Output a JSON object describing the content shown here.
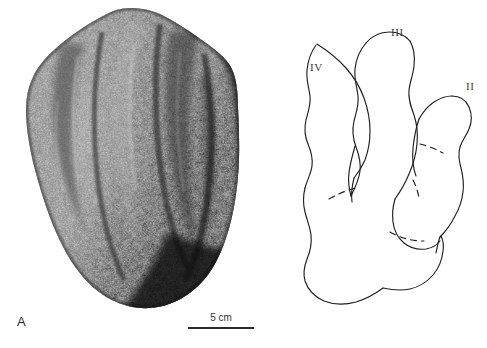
{
  "figure": {
    "width": 487,
    "height": 348,
    "background": "#ffffff"
  },
  "panel_a": {
    "letter": "A",
    "content_name": "rock-specimen-photograph",
    "description": "Greyscale photograph of a coarse rough rock slab bearing a natural cast of a tridactyl footprint",
    "scalebar": {
      "label": "5 cm",
      "length_px": 66
    }
  },
  "panel_b": {
    "letter": "B",
    "content_name": "footprint-interpretive-outline",
    "description": "Interpretive line drawing of the tridactyl footprint with solid outline and dashed pad-crease lines",
    "digit_labels": [
      {
        "id": "IV",
        "text": "IV"
      },
      {
        "id": "III",
        "text": "III"
      },
      {
        "id": "II",
        "text": "II"
      }
    ],
    "scalebar": {
      "label": "5 cm",
      "length_px": 48
    }
  },
  "colors": {
    "ink": "#2a2a2a",
    "label_text": "#2b2b2b",
    "digit_text": "#3a3a3a",
    "scale_text": "#333333",
    "outline_stroke": "#1f1f1f",
    "rock_dark": "#2e2e2e",
    "rock_mid": "#6b6b6b",
    "rock_light": "#a9a9a9",
    "background": "#ffffff"
  }
}
